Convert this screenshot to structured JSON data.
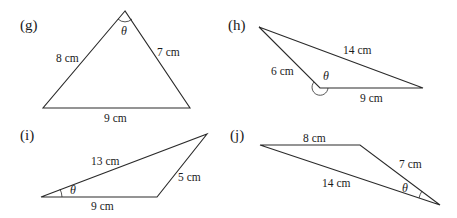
{
  "figures": [
    {
      "id": "g",
      "tag": "(g)",
      "angle_label": "θ",
      "sides": {
        "left": "8 cm",
        "right": "7 cm",
        "bottom": "9 cm"
      }
    },
    {
      "id": "h",
      "tag": "(h)",
      "angle_label": "θ",
      "sides": {
        "top": "14 cm",
        "left": "6 cm",
        "bottom": "9 cm"
      }
    },
    {
      "id": "i",
      "tag": "(i)",
      "angle_label": "θ",
      "sides": {
        "top": "13 cm",
        "right": "5 cm",
        "bottom": "9 cm"
      }
    },
    {
      "id": "j",
      "tag": "(j)",
      "angle_label": "θ",
      "sides": {
        "top": "8 cm",
        "right": "7 cm",
        "bottom": "14 cm"
      }
    }
  ]
}
